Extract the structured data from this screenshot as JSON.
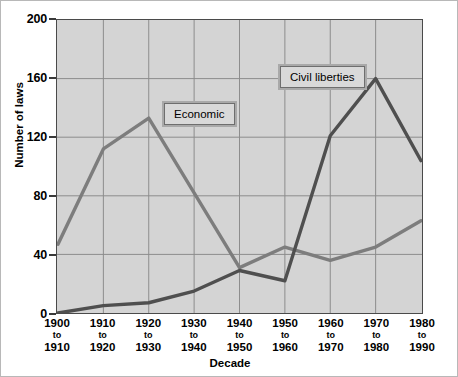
{
  "chart_data": {
    "type": "line",
    "title": "",
    "xlabel": "Decade",
    "ylabel": "Number of laws",
    "ylim": [
      0,
      200
    ],
    "yticks": [
      0,
      40,
      80,
      120,
      160,
      200
    ],
    "grid": true,
    "legend_position": "inline-callouts",
    "categories": [
      "1900 to 1910",
      "1910 to 1920",
      "1920 to 1930",
      "1930 to 1940",
      "1940 to 1950",
      "1950 to 1960",
      "1960 to 1970",
      "1970 to 1980",
      "1980 to 1990"
    ],
    "series": [
      {
        "name": "Economic",
        "color": "#7d7d7d",
        "values": [
          47,
          112,
          133,
          82,
          31,
          45,
          36,
          45,
          63
        ]
      },
      {
        "name": "Civil liberties",
        "color": "#4f4f4f",
        "values": [
          0,
          5,
          7,
          15,
          29,
          22,
          121,
          160,
          104
        ]
      }
    ],
    "annotations": [
      {
        "text": "Economic",
        "target_series": "Economic"
      },
      {
        "text": "Civil liberties",
        "target_series": "Civil liberties"
      }
    ]
  },
  "axes": {
    "y_title": "Number of laws",
    "x_title": "Decade",
    "y_tick_labels": [
      "0",
      "40",
      "80",
      "120",
      "160",
      "200"
    ],
    "x_tick_labels": [
      {
        "start": "1900",
        "mid": "to",
        "end": "1910"
      },
      {
        "start": "1910",
        "mid": "to",
        "end": "1920"
      },
      {
        "start": "1920",
        "mid": "to",
        "end": "1930"
      },
      {
        "start": "1930",
        "mid": "to",
        "end": "1940"
      },
      {
        "start": "1940",
        "mid": "to",
        "end": "1950"
      },
      {
        "start": "1950",
        "mid": "to",
        "end": "1960"
      },
      {
        "start": "1960",
        "mid": "to",
        "end": "1970"
      },
      {
        "start": "1970",
        "mid": "to",
        "end": "1980"
      },
      {
        "start": "1980",
        "mid": "to",
        "end": "1990"
      }
    ]
  },
  "labels": {
    "economic": "Economic",
    "civil_liberties": "Civil liberties"
  },
  "colors": {
    "plot_background": "#d4d4d4",
    "grid": "#8c8c8c",
    "axis": "#4a4a4a",
    "economic_line": "#7d7d7d",
    "civil_liberties_line": "#4f4f4f",
    "callout_fill": "#d9d9d9",
    "callout_border": "#6e6e6e"
  }
}
